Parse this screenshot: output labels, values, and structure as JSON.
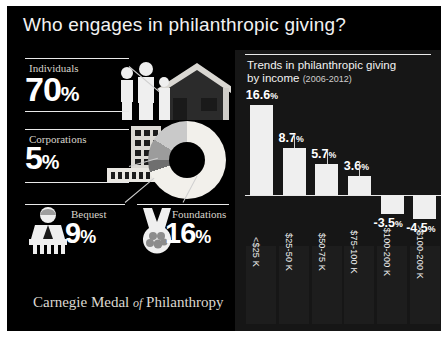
{
  "title": "Who engages in philanthropic giving?",
  "footer": {
    "main": "Carnegie Medal",
    "of": "of",
    "tail": "Philanthropy"
  },
  "stats": [
    {
      "label": "Individuals",
      "value": "70",
      "pct": "%",
      "icon": "family-house-icon"
    },
    {
      "label": "Corporations",
      "value": "5",
      "pct": "%",
      "icon": "office-building-icon"
    },
    {
      "label": "Bequest",
      "value": "9",
      "pct": "%",
      "icon": "person-podium-icon"
    },
    {
      "label": "Foundations",
      "value": "16",
      "pct": "%",
      "icon": "hands-holding-icon"
    }
  ],
  "panel": {
    "title_line1": "Trends in philanthropic giving",
    "title_line2": "by income",
    "years": "(2006-2012)"
  },
  "chart_data": {
    "type": "bar",
    "title": "Trends in philanthropic giving by income (2006-2012)",
    "xlabel": "",
    "ylabel": "",
    "categories": [
      "<$25 K",
      "$25-50 K",
      "$50-75 K",
      "$75-100 K",
      "$100-200 K",
      ">$100-200 K"
    ],
    "values": [
      16.6,
      8.7,
      5.7,
      3.6,
      -3.5,
      -4.5
    ],
    "labels": [
      "16.6%",
      "8.7%",
      "5.7%",
      "3.6%",
      "-3.5%",
      "-4.5%"
    ],
    "ylim": [
      -6,
      18
    ],
    "grid": false,
    "legend": false
  },
  "donut": {
    "type": "pie",
    "segments": [
      {
        "name": "Individuals",
        "value": 70,
        "color": "#f2f0eb"
      },
      {
        "name": "Bequest",
        "value": 5,
        "color": "#6f6f6f"
      },
      {
        "name": "Corporations",
        "value": 9,
        "color": "#9c9c9c"
      },
      {
        "name": "Foundations",
        "value": 16,
        "color": "#c9c9c9"
      }
    ]
  },
  "colors": {
    "bg": "#000000",
    "panel": "#161616",
    "bar": "#efefef",
    "text": "#f2f2f2"
  }
}
